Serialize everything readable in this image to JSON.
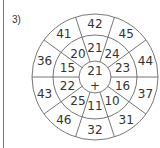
{
  "problem_label": "3)",
  "wheel": {
    "center": {
      "value": "21",
      "operator": "+"
    },
    "inner_ring": [
      "21",
      "24",
      "23",
      "16",
      "10",
      "11",
      "25",
      "22",
      "15",
      "20"
    ],
    "outer_ring": [
      "42",
      "45",
      "44",
      "37",
      "31",
      "32",
      "46",
      "43",
      "36",
      "41"
    ]
  }
}
